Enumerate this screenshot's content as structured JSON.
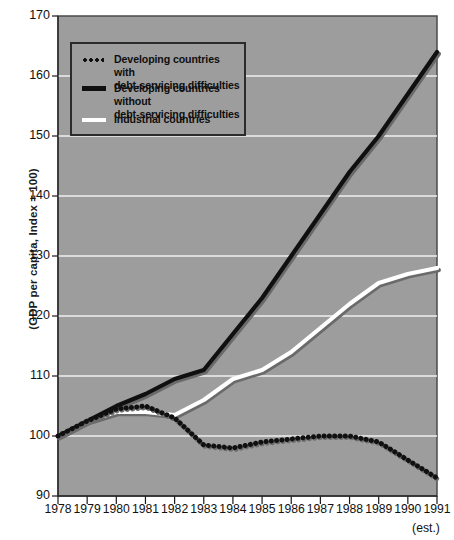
{
  "chart_data": {
    "type": "line",
    "title": "",
    "xlabel": "",
    "ylabel": "(GDP per capita, Index = 100)",
    "x": [
      1978,
      1979,
      1980,
      1981,
      1982,
      1983,
      1984,
      1985,
      1986,
      1987,
      1988,
      1989,
      1990,
      1991
    ],
    "xticklabels": [
      "1978",
      "1979",
      "1980",
      "1981",
      "1982",
      "1983",
      "1984",
      "1985",
      "1986",
      "1987",
      "1988",
      "1989",
      "1990",
      "1991"
    ],
    "x_note": "(est.)",
    "x_note_at": "1991",
    "yticks": [
      90,
      100,
      110,
      120,
      130,
      140,
      150,
      160,
      170
    ],
    "yticklabels": [
      "90",
      "100",
      "110",
      "120",
      "130",
      "140",
      "150",
      "160",
      "170"
    ],
    "ylim": [
      90,
      170
    ],
    "xlim": [
      1978,
      1991
    ],
    "grid": "horizontal",
    "legend_position": "upper left",
    "plot_background": "#9d9d9d",
    "gridline_color": "#f0f0f0",
    "series": [
      {
        "name": "Developing countries with debt-servicing difficulties",
        "style": "dotted",
        "color": "#101010",
        "values": [
          100,
          102.5,
          104.5,
          105,
          103,
          98.5,
          98,
          99,
          99.5,
          100,
          100,
          99,
          96,
          93
        ]
      },
      {
        "name": "Developing countries without debt-servicing difficulties",
        "style": "solid",
        "color": "#101010",
        "values": [
          100,
          102.5,
          105,
          107,
          109.5,
          111,
          117,
          123,
          130,
          137,
          144,
          150,
          157,
          164
        ]
      },
      {
        "name": "Industrial countries",
        "style": "solid",
        "color": "#ffffff",
        "values": [
          100,
          102.5,
          104,
          104,
          103.5,
          106,
          109.5,
          111,
          114,
          118,
          122,
          125.5,
          127,
          128
        ]
      }
    ]
  },
  "legend": {
    "items": [
      {
        "line1": "Developing countries with",
        "line2": "debt-servicing difficulties",
        "marker": "dotted-line-swatch"
      },
      {
        "line1": "Developing countries without",
        "line2": "debt-servicing difficulties",
        "marker": "solid-black-line-swatch"
      },
      {
        "line1": "Industrial countries",
        "line2": "",
        "marker": "solid-white-line-swatch"
      }
    ]
  }
}
